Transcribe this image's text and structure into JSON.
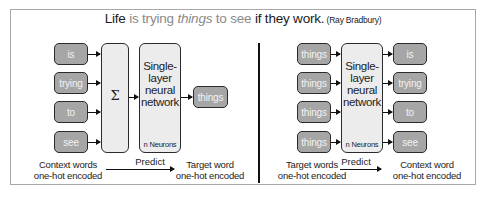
{
  "title": {
    "segments": [
      {
        "text": "Life",
        "style": "dark"
      },
      {
        "text": " is trying ",
        "style": "grey"
      },
      {
        "text": "things",
        "style": "grey-italic"
      },
      {
        "text": " to see ",
        "style": "grey"
      },
      {
        "text": "if they work.",
        "style": "dark"
      },
      {
        "text": " (Ray Bradbury)",
        "style": "attribution"
      }
    ]
  },
  "cbow": {
    "context_words": [
      "is",
      "trying",
      "to",
      "see"
    ],
    "sum_symbol": "Σ",
    "network_label": "Single-\nlayer\nneural\nnetwork",
    "network_lines": [
      "Single-",
      "layer",
      "neural",
      "network"
    ],
    "neurons_label": "n Neurons",
    "output_word": "things",
    "input_caption": [
      "Context words",
      "one-hot encoded"
    ],
    "predict_label": "Predict",
    "output_caption": [
      "Target word",
      "one-hot encoded"
    ]
  },
  "skipgram": {
    "input_words": [
      "things",
      "things",
      "things",
      "things"
    ],
    "network_lines": [
      "Single-",
      "layer",
      "neural",
      "network"
    ],
    "neurons_label": "n Neurons",
    "output_words": [
      "is",
      "trying",
      "to",
      "see"
    ],
    "input_caption": [
      "Target words",
      "one-hot encoded"
    ],
    "predict_label": "Predict",
    "output_caption": [
      "Context word",
      "one-hot encoded"
    ]
  },
  "colors": {
    "word_box_fill": "#a6a6a6",
    "word_box_text": "#f2f2f2",
    "block_fill": "#ececec",
    "stroke": "#2b2b2b",
    "title_grey": "#8a8a8a",
    "frame_border": "#a8a8a8"
  }
}
